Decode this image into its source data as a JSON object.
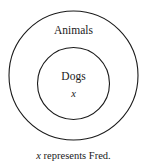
{
  "figure": {
    "type": "venn-nested-circles",
    "background_color": "#ffffff",
    "stroke_color": "#1a1a1a",
    "outer_set": {
      "label": "Animals",
      "center_x": 73.5,
      "center_y": 75.5,
      "radius": 64.5
    },
    "inner_set": {
      "label": "Dogs",
      "center_x": 73.5,
      "center_y": 83.5,
      "radius": 36
    },
    "element": {
      "symbol": "x",
      "inside_set": "Dogs"
    },
    "caption": {
      "variable": "x",
      "text": " represents Fred.",
      "full_text": "x represents Fred."
    }
  }
}
